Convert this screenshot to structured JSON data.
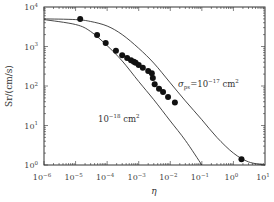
{
  "chart_data": {
    "type": "scatter",
    "title": "",
    "xlabel": "η",
    "ylabel": "Sr/(cm/s)",
    "xscale": "log",
    "yscale": "log",
    "xlim": [
      1e-06,
      10
    ],
    "ylim": [
      1,
      10000
    ],
    "grid": false,
    "legend": null,
    "x_ticks": [
      {
        "base": "10",
        "exp": "−6",
        "value": 1e-06
      },
      {
        "base": "10",
        "exp": "−5",
        "value": 1e-05
      },
      {
        "base": "10",
        "exp": "−4",
        "value": 0.0001
      },
      {
        "base": "10",
        "exp": "−3",
        "value": 0.001
      },
      {
        "base": "10",
        "exp": "−2",
        "value": 0.01
      },
      {
        "base": "10",
        "exp": "−1",
        "value": 0.1
      },
      {
        "base": "10",
        "exp": "0",
        "value": 1
      },
      {
        "base": "10",
        "exp": "1",
        "value": 10
      }
    ],
    "y_ticks": [
      {
        "base": "10",
        "exp": "0",
        "value": 1
      },
      {
        "base": "10",
        "exp": "1",
        "value": 10
      },
      {
        "base": "10",
        "exp": "2",
        "value": 100
      },
      {
        "base": "10",
        "exp": "3",
        "value": 1000
      },
      {
        "base": "10",
        "exp": "4",
        "value": 10000
      }
    ],
    "series": [
      {
        "name": "measured",
        "kind": "scatter",
        "marker": "filled-circle",
        "color": "#111111",
        "points": [
          [
            1.4e-05,
            5000
          ],
          [
            4.8e-05,
            1950
          ],
          [
            9e-05,
            1230
          ],
          [
            0.00019,
            780
          ],
          [
            0.0003,
            600
          ],
          [
            0.00043,
            510
          ],
          [
            0.00057,
            450
          ],
          [
            0.0007,
            410
          ],
          [
            0.0008,
            390
          ],
          [
            0.001,
            340
          ],
          [
            0.00135,
            290
          ],
          [
            0.002,
            240
          ],
          [
            0.0026,
            210
          ],
          [
            0.0028,
            160
          ],
          [
            0.0032,
            110
          ],
          [
            0.0044,
            85
          ],
          [
            0.0059,
            70
          ],
          [
            0.0085,
            53
          ],
          [
            0.014,
            38
          ],
          [
            1.8,
            1.4
          ]
        ]
      },
      {
        "name": "σps = 1e-17 cm²",
        "kind": "line",
        "color": "#333333",
        "points": [
          [
            1e-06,
            5000
          ],
          [
            1e-05,
            4800
          ],
          [
            3e-05,
            4300
          ],
          [
            0.0001,
            3300
          ],
          [
            0.0003,
            2000
          ],
          [
            0.001,
            900
          ],
          [
            0.003,
            380
          ],
          [
            0.01,
            120
          ],
          [
            0.03,
            42
          ],
          [
            0.1,
            14
          ],
          [
            0.3,
            5
          ],
          [
            1,
            2
          ],
          [
            3,
            1.2
          ],
          [
            10,
            1.0
          ]
        ]
      },
      {
        "name": "1e-18 cm²",
        "kind": "line",
        "color": "#333333",
        "points": [
          [
            1e-06,
            4800
          ],
          [
            1e-05,
            3600
          ],
          [
            3e-05,
            2400
          ],
          [
            0.0001,
            1050
          ],
          [
            0.0003,
            430
          ],
          [
            0.001,
            130
          ],
          [
            0.003,
            45
          ],
          [
            0.01,
            13
          ],
          [
            0.03,
            4.2
          ],
          [
            0.1,
            1.0
          ]
        ]
      }
    ],
    "annotations": [
      {
        "text_main": "σ",
        "text_sub": "ps",
        "text_rest": "=10",
        "text_sup": "−17",
        "text_unit": " cm",
        "text_unit_sup": "2",
        "x": 0.03,
        "y": 190
      },
      {
        "text_main": "10",
        "text_sup": "−18",
        "text_unit": " cm",
        "text_unit_sup": "2",
        "x": 6e-05,
        "y": 25
      }
    ]
  },
  "labels": {
    "xlabel": "η",
    "ylabel": "Sr/(cm/s)",
    "annot1_sigma": "σ",
    "annot1_sub": "ps",
    "annot1_eq": "=10",
    "annot1_sup": "−17",
    "annot1_unit": " cm",
    "annot1_unit_sup": "2",
    "annot2_base": "10",
    "annot2_sup": "−18",
    "annot2_unit": " cm",
    "annot2_unit_sup": "2"
  }
}
